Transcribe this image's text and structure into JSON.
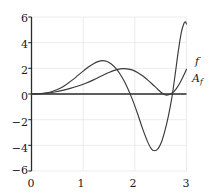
{
  "chart_data": {
    "type": "line",
    "title": "",
    "xlabel": "",
    "ylabel": "",
    "xlim": [
      0,
      3
    ],
    "ylim": [
      -6,
      6
    ],
    "grid": true,
    "grid_color": "#e8e6ea",
    "axis_color": "#2b2b2b",
    "curve_color": "#3a3a3a",
    "background": "#ffffff",
    "legend_position": "right-inline",
    "xticks": [
      "0",
      "1",
      "2",
      "3"
    ],
    "xtick_values": [
      0,
      1,
      2,
      3
    ],
    "yticks": [
      "6",
      "4",
      "2",
      "0",
      "−2",
      "−4",
      "−6"
    ],
    "ytick_values": [
      6,
      4,
      2,
      0,
      -2,
      -4,
      -6
    ],
    "series": [
      {
        "name": "f",
        "label": "f",
        "label_base": "f",
        "label_sub": "",
        "annotation_x": 3.02,
        "annotation_y": 3.0,
        "points": [
          [
            0.0,
            0.0
          ],
          [
            0.1,
            0.01
          ],
          [
            0.2,
            0.04
          ],
          [
            0.3,
            0.1
          ],
          [
            0.4,
            0.2
          ],
          [
            0.5,
            0.35
          ],
          [
            0.6,
            0.55
          ],
          [
            0.7,
            0.82
          ],
          [
            0.8,
            1.12
          ],
          [
            0.9,
            1.45
          ],
          [
            1.0,
            1.78
          ],
          [
            1.1,
            2.1
          ],
          [
            1.2,
            2.36
          ],
          [
            1.3,
            2.54
          ],
          [
            1.37,
            2.6
          ],
          [
            1.45,
            2.55
          ],
          [
            1.55,
            2.32
          ],
          [
            1.65,
            1.92
          ],
          [
            1.75,
            1.32
          ],
          [
            1.85,
            0.55
          ],
          [
            1.95,
            -0.4
          ],
          [
            2.05,
            -1.5
          ],
          [
            2.15,
            -2.7
          ],
          [
            2.25,
            -3.75
          ],
          [
            2.32,
            -4.28
          ],
          [
            2.38,
            -4.42
          ],
          [
            2.45,
            -4.25
          ],
          [
            2.52,
            -3.7
          ],
          [
            2.58,
            -2.9
          ],
          [
            2.65,
            -1.7
          ],
          [
            2.72,
            -0.2
          ],
          [
            2.78,
            1.5
          ],
          [
            2.84,
            3.3
          ],
          [
            2.9,
            4.8
          ],
          [
            2.95,
            5.5
          ],
          [
            2.98,
            5.62
          ],
          [
            3.0,
            5.45
          ]
        ]
      },
      {
        "name": "A_f",
        "label": "A_f",
        "label_base": "A",
        "label_sub": "f",
        "annotation_x": 3.02,
        "annotation_y": 2.0,
        "points": [
          [
            0.0,
            0.0
          ],
          [
            0.15,
            0.02
          ],
          [
            0.3,
            0.07
          ],
          [
            0.45,
            0.16
          ],
          [
            0.6,
            0.28
          ],
          [
            0.75,
            0.44
          ],
          [
            0.9,
            0.62
          ],
          [
            1.05,
            0.84
          ],
          [
            1.2,
            1.1
          ],
          [
            1.35,
            1.4
          ],
          [
            1.5,
            1.68
          ],
          [
            1.62,
            1.86
          ],
          [
            1.72,
            1.96
          ],
          [
            1.8,
            1.98
          ],
          [
            1.88,
            1.94
          ],
          [
            1.97,
            1.84
          ],
          [
            2.06,
            1.66
          ],
          [
            2.15,
            1.42
          ],
          [
            2.24,
            1.12
          ],
          [
            2.33,
            0.8
          ],
          [
            2.42,
            0.46
          ],
          [
            2.5,
            0.16
          ],
          [
            2.56,
            -0.02
          ],
          [
            2.6,
            -0.08
          ],
          [
            2.64,
            -0.08
          ],
          [
            2.7,
            0.02
          ],
          [
            2.76,
            0.2
          ],
          [
            2.82,
            0.52
          ],
          [
            2.88,
            0.92
          ],
          [
            2.94,
            1.4
          ],
          [
            3.0,
            1.92
          ]
        ]
      }
    ]
  }
}
